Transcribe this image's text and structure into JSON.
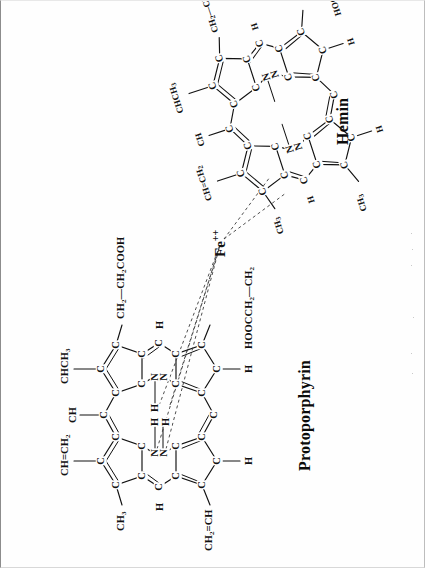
{
  "figure": {
    "kind": "chemical-structure-diagram",
    "background_color": "#fefefe",
    "ink_color": "#111111",
    "border_color": "#8c8c8c"
  },
  "labels": {
    "protoporphyrin_title": "Protoporphyrin",
    "hemin_title": "Hemin",
    "iron_center": "Fe",
    "iron_charge": "++"
  },
  "protoporphyrin": {
    "title": "Protoporphyrin",
    "core_atoms": [
      "N",
      "N",
      "N",
      "N",
      "H",
      "H"
    ],
    "meso_labels": [
      "CH",
      "H",
      "H",
      "H"
    ],
    "substituents": [
      {
        "id": "pp-vinyl-top",
        "text": "CH=CH",
        "sub": "2"
      },
      {
        "id": "pp-methyl-topleft",
        "text": "CH",
        "sub": "3"
      },
      {
        "id": "pp-meso-top",
        "text": "CH"
      },
      {
        "id": "pp-ethylidene",
        "text": "CHCH",
        "sub": "3"
      },
      {
        "id": "pp-propionate-right",
        "text": "CH2—CH2COOH"
      },
      {
        "id": "pp-vinyl-left",
        "text": "CH2=CH"
      },
      {
        "id": "pp-propionate-bottom",
        "text": "HOOCCH2—CH2"
      },
      {
        "id": "pp-meso-h-left",
        "text": "H"
      },
      {
        "id": "pp-meso-h-right",
        "text": "H"
      },
      {
        "id": "pp-meso-h-bottomleft",
        "text": "H"
      },
      {
        "id": "pp-meso-h-bottomright",
        "text": "H"
      }
    ]
  },
  "hemin": {
    "title": "Hemin",
    "core_atoms": [
      "N",
      "N",
      "N",
      "N"
    ],
    "substituents": [
      {
        "id": "hm-vinyl-top",
        "text": "CH=CH",
        "sub": "2"
      },
      {
        "id": "hm-methyl-top",
        "text": "CH",
        "sub": "3"
      },
      {
        "id": "hm-meso-top",
        "text": "CH"
      },
      {
        "id": "hm-ethylidene",
        "text": "CHCH",
        "sub": "3"
      },
      {
        "id": "hm-propionate-right",
        "text": "CH2—CH2COOH"
      },
      {
        "id": "hm-methyl-left",
        "text": "CH",
        "sub": "3"
      },
      {
        "id": "hm-vinyl-left",
        "text": "CH=CH",
        "sub": "2"
      },
      {
        "id": "hm-propionate-bottom",
        "text": "HOOCCH",
        "sub": "2"
      },
      {
        "id": "hm-meso-h-a",
        "text": "H"
      },
      {
        "id": "hm-meso-h-b",
        "text": "H"
      },
      {
        "id": "hm-meso-h-c",
        "text": "H"
      },
      {
        "id": "hm-meso-h-d",
        "text": "H"
      }
    ]
  }
}
